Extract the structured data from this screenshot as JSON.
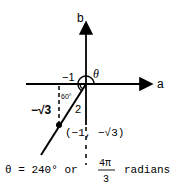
{
  "diagram": {
    "axes": {
      "horizontal_label": "a",
      "vertical_label": "b"
    },
    "angle_label": "θ",
    "reference_angle_label": "60°",
    "x_leg_label": "−1",
    "y_leg_label": "−√3",
    "hypotenuse_label": "2",
    "point_label": "(−1, −√3)",
    "caption": {
      "prefix": "θ = 240° or",
      "fraction_numerator": "4π",
      "fraction_denominator": "3",
      "suffix": "radians"
    }
  }
}
